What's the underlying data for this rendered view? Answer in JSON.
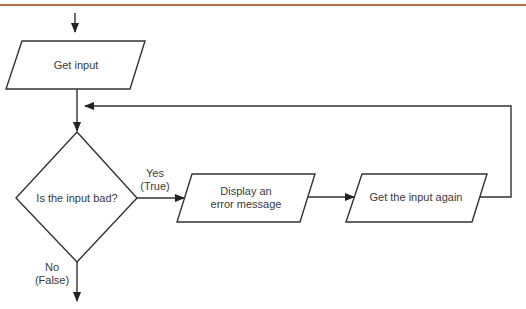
{
  "colors": {
    "rule": "#b0704a",
    "stroke": "#333333",
    "text": "#3a3a3a",
    "background": "#ffffff"
  },
  "nodes": {
    "get_input": {
      "type": "input-output",
      "label": "Get input"
    },
    "decision": {
      "type": "decision",
      "label": "Is the input bad?"
    },
    "display_error": {
      "type": "input-output",
      "label_line1": "Display an",
      "label_line2": "error message"
    },
    "get_again": {
      "type": "input-output",
      "label": "Get the input again"
    }
  },
  "edges": {
    "yes": {
      "line1": "Yes",
      "line2": "(True)"
    },
    "no": {
      "line1": "No",
      "line2": "(False)"
    }
  }
}
